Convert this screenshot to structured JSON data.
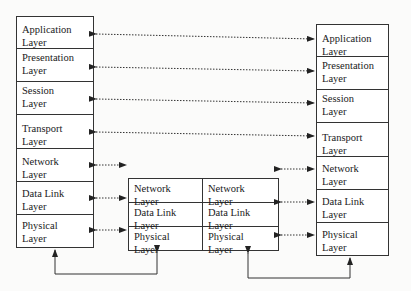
{
  "diagram": {
    "title": "",
    "left_stack": {
      "layers": [
        {
          "line1": "Application",
          "line2": "Layer"
        },
        {
          "line1": "Presentation",
          "line2": "Layer"
        },
        {
          "line1": "Session",
          "line2": "Layer"
        },
        {
          "line1": "Transport",
          "line2": "Layer"
        },
        {
          "line1": "Network",
          "line2": "Layer"
        },
        {
          "line1": "Data Link",
          "line2": "Layer"
        },
        {
          "line1": "Physical",
          "line2": "Layer"
        }
      ]
    },
    "router": {
      "left_column": [
        {
          "line1": "Network",
          "line2": "Layer"
        },
        {
          "line1": "Data Link",
          "line2": "Layer"
        },
        {
          "line1": "Physical",
          "line2": "Layer"
        }
      ],
      "right_column": [
        {
          "line1": "Network",
          "line2": "Layer"
        },
        {
          "line1": "Data Link",
          "line2": "Layer"
        },
        {
          "line1": "Physical",
          "line2": "Layer"
        }
      ]
    },
    "right_stack": {
      "layers": [
        {
          "line1": "Application",
          "line2": "Layer"
        },
        {
          "line1": "Presentation",
          "line2": "Layer"
        },
        {
          "line1": "Session",
          "line2": "Layer"
        },
        {
          "line1": "Transport",
          "line2": "Layer"
        },
        {
          "line1": "Network",
          "line2": "Layer"
        },
        {
          "line1": "Data Link",
          "line2": "Layer"
        },
        {
          "line1": "Physical",
          "line2": "Layer"
        }
      ]
    },
    "connections": {
      "peer_links": [
        "Application",
        "Presentation",
        "Session",
        "Transport"
      ],
      "hop_links_left": [
        "Network",
        "Data Link",
        "Physical"
      ],
      "hop_links_right": [
        "Network",
        "Data Link",
        "Physical"
      ],
      "physical_links": [
        "left-host-to-router",
        "router-to-right-host"
      ]
    },
    "colors": {
      "line": "#222222",
      "background": "#fbfbfa"
    }
  }
}
